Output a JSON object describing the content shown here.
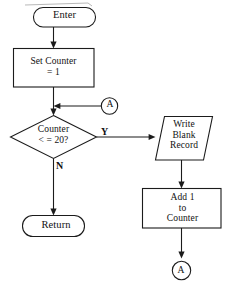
{
  "diagram": {
    "line_color": "#1b1b1b",
    "fill_color": "#ffffff",
    "nodes": {
      "enter": {
        "label": "Enter",
        "shape": "terminator"
      },
      "set_counter": {
        "label": "Set Counter\n= 1",
        "shape": "process"
      },
      "decision": {
        "label": "Counter\n< = 20?",
        "shape": "decision"
      },
      "write_record": {
        "label": "Write\nBlank\nRecord",
        "shape": "input-output"
      },
      "add_counter": {
        "label": "Add 1\nto\nCounter",
        "shape": "process"
      },
      "return": {
        "label": "Return",
        "shape": "terminator"
      },
      "connector_in": {
        "label": "A",
        "shape": "connector"
      },
      "connector_out": {
        "label": "A",
        "shape": "connector"
      }
    },
    "edge_labels": {
      "yes": "Y",
      "no": "N"
    }
  }
}
